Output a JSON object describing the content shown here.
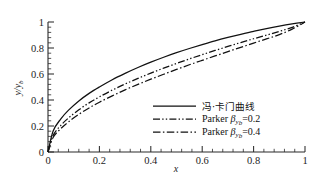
{
  "chart_data": {
    "type": "line",
    "title": "",
    "xlabel": "x",
    "ylabel": "y/y_b",
    "ylabel_main": "y/y",
    "ylabel_sub": "b",
    "xlim": [
      0,
      1
    ],
    "ylim": [
      0,
      1
    ],
    "grid": false,
    "legend_position": "center-right-inside",
    "x_ticks": [
      "0",
      "0.2",
      "0.4",
      "0.6",
      "0.8",
      "1"
    ],
    "x_tick_values": [
      0,
      0.2,
      0.4,
      0.6,
      0.8,
      1
    ],
    "x_minor_count_per_interval": 4,
    "y_ticks": [
      "0",
      "0.2",
      "0.4",
      "0.6",
      "0.8",
      "1"
    ],
    "y_tick_values": [
      0,
      0.2,
      0.4,
      0.6,
      0.8,
      1
    ],
    "y_minor_count_per_interval": 4,
    "series": [
      {
        "name": "冯·卡门曲线",
        "style": "solid",
        "x": [
          0,
          0.02,
          0.05,
          0.08,
          0.12,
          0.16,
          0.2,
          0.25,
          0.3,
          0.35,
          0.4,
          0.45,
          0.5,
          0.55,
          0.6,
          0.65,
          0.7,
          0.75,
          0.8,
          0.85,
          0.9,
          0.95,
          1
        ],
        "values": [
          0,
          0.162,
          0.255,
          0.322,
          0.393,
          0.451,
          0.5,
          0.556,
          0.605,
          0.65,
          0.691,
          0.729,
          0.764,
          0.796,
          0.826,
          0.855,
          0.881,
          0.905,
          0.928,
          0.949,
          0.968,
          0.985,
          1
        ]
      },
      {
        "name": "Parker βyb=0.2",
        "style": "dash-dot-dot",
        "x": [
          0,
          0.02,
          0.05,
          0.08,
          0.12,
          0.16,
          0.2,
          0.25,
          0.3,
          0.35,
          0.4,
          0.45,
          0.5,
          0.55,
          0.6,
          0.65,
          0.7,
          0.75,
          0.8,
          0.85,
          0.9,
          0.95,
          1
        ],
        "values": [
          0,
          0.128,
          0.205,
          0.262,
          0.325,
          0.378,
          0.424,
          0.476,
          0.523,
          0.566,
          0.607,
          0.645,
          0.681,
          0.716,
          0.749,
          0.781,
          0.812,
          0.842,
          0.871,
          0.899,
          0.928,
          0.959,
          1
        ]
      },
      {
        "name": "Parker βyb=0.4",
        "style": "dash-dot",
        "x": [
          0,
          0.02,
          0.05,
          0.08,
          0.12,
          0.16,
          0.2,
          0.25,
          0.3,
          0.35,
          0.4,
          0.45,
          0.5,
          0.55,
          0.6,
          0.65,
          0.7,
          0.75,
          0.8,
          0.85,
          0.9,
          0.95,
          1
        ],
        "values": [
          0,
          0.112,
          0.18,
          0.232,
          0.29,
          0.339,
          0.383,
          0.432,
          0.478,
          0.52,
          0.56,
          0.598,
          0.635,
          0.671,
          0.705,
          0.739,
          0.772,
          0.805,
          0.838,
          0.87,
          0.903,
          0.945,
          1
        ]
      }
    ]
  },
  "legend": {
    "items": [
      {
        "label": "冯·卡门曲线",
        "lang": "cn",
        "style": "solid"
      },
      {
        "label_prefix": "Parker ",
        "beta": "β",
        "sub": "y",
        "sub2": "b",
        "suffix": "=0.2",
        "lang": "en",
        "style": "dash-dot-dot"
      },
      {
        "label_prefix": "Parker ",
        "beta": "β",
        "sub": "y",
        "sub2": "b",
        "suffix": "=0.4",
        "lang": "en",
        "style": "dash-dot"
      }
    ]
  },
  "colors": {
    "curve": "#111111",
    "axis": "#2b2b2b",
    "text": "#1c1c1c",
    "background": "#ffffff"
  }
}
